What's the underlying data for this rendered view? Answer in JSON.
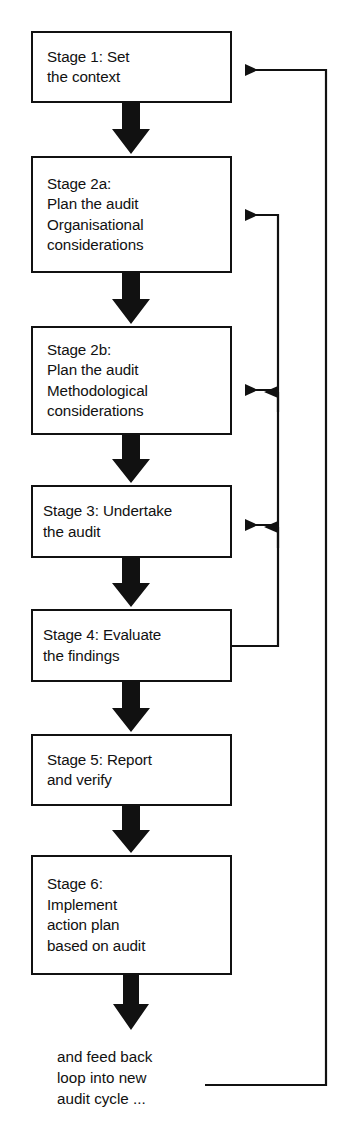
{
  "diagram": {
    "stroke_color": "#111111",
    "fill_color": "#ffffff",
    "nodes": [
      {
        "id": "stage1",
        "label": "Stage 1: Set\nthe context",
        "x": 31,
        "y": 31,
        "w": 201,
        "h": 72
      },
      {
        "id": "stage2a",
        "label": "Stage 2a:\nPlan the audit\nOrganisational\nconsiderations",
        "x": 31,
        "y": 156,
        "w": 201,
        "h": 117
      },
      {
        "id": "stage2b",
        "label": "Stage 2b:\nPlan the audit\nMethodological\nconsiderations",
        "x": 31,
        "y": 326,
        "w": 201,
        "h": 109
      },
      {
        "id": "stage3",
        "label": "Stage 3: Undertake\nthe audit",
        "x": 31,
        "y": 485,
        "w": 201,
        "h": 73
      },
      {
        "id": "stage4",
        "label": "Stage 4: Evaluate\nthe findings",
        "x": 31,
        "y": 609,
        "w": 201,
        "h": 73
      },
      {
        "id": "stage5",
        "label": "Stage 5: Report\nand verify",
        "x": 31,
        "y": 734,
        "w": 201,
        "h": 72
      },
      {
        "id": "stage6",
        "label": "Stage 6:\nImplement\naction plan\nbased on audit",
        "x": 31,
        "y": 855,
        "w": 201,
        "h": 120
      }
    ],
    "tail_note": {
      "label": "and feed back\nloop into new\naudit cycle ...",
      "x": 57,
      "y": 1046
    },
    "down_arrows": [
      {
        "from": "stage1",
        "to": "stage2a",
        "x": 131,
        "y1": 103,
        "y2": 156
      },
      {
        "from": "stage2a",
        "to": "stage2b",
        "x": 131,
        "y1": 273,
        "y2": 326
      },
      {
        "from": "stage2b",
        "to": "stage3",
        "x": 131,
        "y1": 435,
        "y2": 485
      },
      {
        "from": "stage3",
        "to": "stage4",
        "x": 131,
        "y1": 558,
        "y2": 609
      },
      {
        "from": "stage4",
        "to": "stage5",
        "x": 131,
        "y1": 682,
        "y2": 734
      },
      {
        "from": "stage5",
        "to": "stage6",
        "x": 131,
        "y1": 806,
        "y2": 855
      },
      {
        "from": "stage6",
        "to": "tail-note",
        "x": 131,
        "y1": 975,
        "y2": 1030
      }
    ],
    "feedback_loops": [
      {
        "id": "loop-outer-to-stage1",
        "label": "and feed back loop into new audit cycle",
        "from_x": 205,
        "from_y": 1085,
        "rail_x": 326,
        "to_x": 232,
        "to_y": 70
      },
      {
        "id": "loop-stage4-to-stage2a",
        "label": "Stage 4 back to Stage 2a",
        "from_x": 232,
        "from_y": 646,
        "rail_x": 278,
        "to_x": 232,
        "to_y": 215
      },
      {
        "id": "loop-rail-to-stage2b",
        "label": "feedback into Stage 2b",
        "rail_x": 278,
        "to_x": 232,
        "to_y": 390
      },
      {
        "id": "loop-rail-to-stage3",
        "label": "feedback into Stage 3",
        "rail_x": 278,
        "to_x": 232,
        "to_y": 525
      }
    ]
  }
}
